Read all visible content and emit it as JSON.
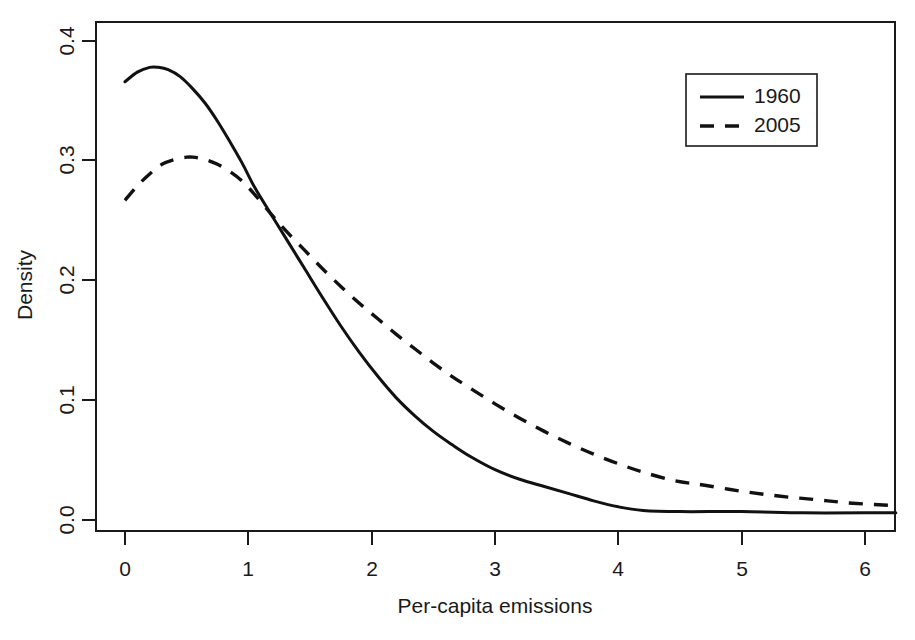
{
  "chart_data": {
    "type": "line",
    "title": "",
    "xlabel": "Per-capita emissions",
    "ylabel": "Density",
    "xlim": [
      -0.15,
      6.35
    ],
    "ylim": [
      -0.012,
      0.412
    ],
    "xticks": [
      0,
      1,
      2,
      3,
      4,
      5,
      6
    ],
    "xticklabels": [
      "0",
      "1",
      "2",
      "3",
      "4",
      "5",
      "6"
    ],
    "yticks": [
      0.0,
      0.1,
      0.2,
      0.3,
      0.4
    ],
    "yticklabels": [
      "0.0",
      "0.1",
      "0.2",
      "0.3",
      "0.4"
    ],
    "grid": false,
    "legend_position": "top-right",
    "series": [
      {
        "name": "1960",
        "style": "solid",
        "color": "#111111",
        "x": [
          0.0,
          0.1,
          0.2,
          0.27,
          0.35,
          0.45,
          0.55,
          0.65,
          0.75,
          0.85,
          0.95,
          1.05,
          1.18,
          1.3,
          1.45,
          1.6,
          1.75,
          1.9,
          2.05,
          2.2,
          2.35,
          2.5,
          2.65,
          2.8,
          3.0,
          3.2,
          3.4,
          3.6,
          3.8,
          4.0,
          4.2,
          4.5,
          5.0,
          5.5,
          6.0,
          6.25
        ],
        "y": [
          0.366,
          0.374,
          0.378,
          0.378,
          0.376,
          0.37,
          0.36,
          0.348,
          0.333,
          0.316,
          0.298,
          0.278,
          0.256,
          0.236,
          0.211,
          0.186,
          0.162,
          0.14,
          0.12,
          0.102,
          0.087,
          0.074,
          0.063,
          0.053,
          0.042,
          0.034,
          0.028,
          0.022,
          0.016,
          0.011,
          0.008,
          0.007,
          0.007,
          0.006,
          0.006,
          0.006
        ]
      },
      {
        "name": "2005",
        "style": "dashed",
        "color": "#111111",
        "x": [
          0.0,
          0.1,
          0.2,
          0.3,
          0.4,
          0.5,
          0.55,
          0.65,
          0.75,
          0.85,
          0.95,
          1.05,
          1.18,
          1.3,
          1.45,
          1.6,
          1.75,
          1.9,
          2.05,
          2.2,
          2.35,
          2.5,
          2.65,
          2.8,
          3.0,
          3.2,
          3.4,
          3.6,
          3.8,
          4.0,
          4.2,
          4.45,
          4.7,
          5.0,
          5.3,
          5.6,
          5.9,
          6.25
        ],
        "y": [
          0.267,
          0.279,
          0.289,
          0.297,
          0.301,
          0.303,
          0.303,
          0.301,
          0.297,
          0.291,
          0.283,
          0.272,
          0.256,
          0.242,
          0.226,
          0.21,
          0.195,
          0.181,
          0.168,
          0.155,
          0.143,
          0.131,
          0.12,
          0.11,
          0.097,
          0.085,
          0.074,
          0.064,
          0.055,
          0.047,
          0.04,
          0.033,
          0.029,
          0.024,
          0.02,
          0.017,
          0.014,
          0.012
        ]
      }
    ],
    "legend": [
      {
        "label": "1960",
        "style": "solid"
      },
      {
        "label": "2005",
        "style": "dashed"
      }
    ]
  }
}
